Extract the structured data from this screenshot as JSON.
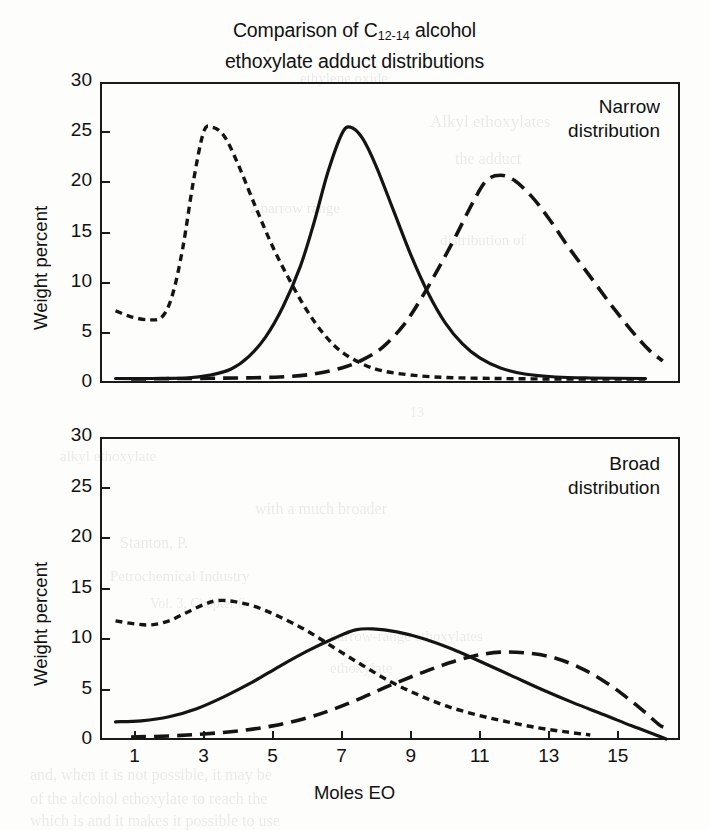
{
  "figure": {
    "title_line1_pre": "Comparison of C",
    "title_sub": "12-14",
    "title_line1_post": " alcohol",
    "title_line2": "ethoxylate adduct distributions",
    "ink_color": "#141414"
  },
  "axes": {
    "ylabel": "Weight percent",
    "xlabel": "Moles EO",
    "yticks": [
      "0",
      "5",
      "10",
      "15",
      "20",
      "25",
      "30"
    ],
    "xticks": [
      "1",
      "3",
      "5",
      "7",
      "9",
      "11",
      "13",
      "15"
    ]
  },
  "panels": {
    "top": {
      "annotation_line1": "Narrow",
      "annotation_line2": "distribution"
    },
    "bottom": {
      "annotation_line1": "Broad",
      "annotation_line2": "distribution"
    }
  },
  "bleed_through": [
    {
      "text": "ethylene oxide",
      "x": 300,
      "y": 70,
      "size": 15
    },
    {
      "text": "Alkyl ethoxylates",
      "x": 430,
      "y": 112,
      "size": 17
    },
    {
      "text": "the adduct",
      "x": 455,
      "y": 150,
      "size": 16
    },
    {
      "text": "a narrow range",
      "x": 250,
      "y": 200,
      "size": 15
    },
    {
      "text": "distribution of",
      "x": 440,
      "y": 232,
      "size": 15
    },
    {
      "text": "13",
      "x": 410,
      "y": 405,
      "size": 14
    },
    {
      "text": "alkyl ethoxylate",
      "x": 60,
      "y": 448,
      "size": 15
    },
    {
      "text": "with a much broader",
      "x": 255,
      "y": 500,
      "size": 16
    },
    {
      "text": "Stanton, P.",
      "x": 120,
      "y": 534,
      "size": 16
    },
    {
      "text": "Petrochemical Industry",
      "x": 110,
      "y": 568,
      "size": 15
    },
    {
      "text": "Vol. 3, Chapter 6",
      "x": 150,
      "y": 596,
      "size": 14
    },
    {
      "text": "narrow-range ethoxylates",
      "x": 330,
      "y": 628,
      "size": 15
    },
    {
      "text": "ethoxylate",
      "x": 330,
      "y": 660,
      "size": 15
    },
    {
      "text": "and, when it is not possible, it may be",
      "x": 30,
      "y": 766,
      "size": 16
    },
    {
      "text": "of the alcohol ethoxylate to reach the",
      "x": 30,
      "y": 790,
      "size": 16
    },
    {
      "text": "which is and it makes it possible to use",
      "x": 30,
      "y": 812,
      "size": 16
    }
  ],
  "chart_data": [
    {
      "type": "line",
      "title": "Narrow distribution",
      "xlabel": "Moles EO",
      "ylabel": "Weight percent",
      "xlim": [
        0,
        16.8
      ],
      "ylim": [
        0,
        30
      ],
      "grid": false,
      "legend": "none",
      "series": [
        {
          "name": "short-dash distribution (low adduct)",
          "style": "short-dash",
          "peak_x": 3.0,
          "peak_y": 25.5,
          "points": [
            [
              0.45,
              7.2
            ],
            [
              0.9,
              6.6
            ],
            [
              1.4,
              6.3
            ],
            [
              1.8,
              6.6
            ],
            [
              2.1,
              8.8
            ],
            [
              2.4,
              13.5
            ],
            [
              2.7,
              20.0
            ],
            [
              3.0,
              25.0
            ],
            [
              3.25,
              25.5
            ],
            [
              3.6,
              24.6
            ],
            [
              4.0,
              21.8
            ],
            [
              4.5,
              17.6
            ],
            [
              5.0,
              13.6
            ],
            [
              5.5,
              10.2
            ],
            [
              6.0,
              7.2
            ],
            [
              6.5,
              4.8
            ],
            [
              7.0,
              3.1
            ],
            [
              7.6,
              1.9
            ],
            [
              8.2,
              1.2
            ],
            [
              9.0,
              0.8
            ],
            [
              10.0,
              0.55
            ],
            [
              11.5,
              0.45
            ],
            [
              13.0,
              0.4
            ],
            [
              14.5,
              0.4
            ],
            [
              15.8,
              0.4
            ]
          ]
        },
        {
          "name": "solid distribution (mid adduct)",
          "style": "solid",
          "peak_x": 7.0,
          "peak_y": 25.5,
          "points": [
            [
              0.45,
              0.45
            ],
            [
              1.5,
              0.45
            ],
            [
              2.5,
              0.5
            ],
            [
              3.2,
              0.8
            ],
            [
              3.8,
              1.4
            ],
            [
              4.3,
              2.6
            ],
            [
              4.8,
              4.6
            ],
            [
              5.3,
              7.6
            ],
            [
              5.8,
              11.6
            ],
            [
              6.2,
              16.0
            ],
            [
              6.6,
              21.0
            ],
            [
              7.0,
              24.8
            ],
            [
              7.25,
              25.5
            ],
            [
              7.6,
              24.4
            ],
            [
              8.0,
              21.6
            ],
            [
              8.5,
              17.2
            ],
            [
              9.0,
              12.8
            ],
            [
              9.5,
              9.0
            ],
            [
              10.0,
              6.0
            ],
            [
              10.5,
              3.9
            ],
            [
              11.0,
              2.5
            ],
            [
              11.6,
              1.5
            ],
            [
              12.3,
              0.9
            ],
            [
              13.2,
              0.6
            ],
            [
              14.2,
              0.5
            ],
            [
              15.8,
              0.45
            ]
          ]
        },
        {
          "name": "long-dash distribution (high adduct)",
          "style": "long-dash",
          "peak_x": 11.2,
          "peak_y": 20.7,
          "points": [
            [
              0.9,
              0.4
            ],
            [
              2.5,
              0.45
            ],
            [
              4.0,
              0.5
            ],
            [
              5.2,
              0.6
            ],
            [
              6.2,
              0.9
            ],
            [
              7.0,
              1.5
            ],
            [
              7.6,
              2.3
            ],
            [
              8.2,
              3.6
            ],
            [
              8.8,
              5.8
            ],
            [
              9.3,
              8.4
            ],
            [
              9.8,
              11.4
            ],
            [
              10.3,
              14.6
            ],
            [
              10.8,
              18.0
            ],
            [
              11.2,
              20.2
            ],
            [
              11.6,
              20.7
            ],
            [
              12.0,
              20.2
            ],
            [
              12.5,
              18.6
            ],
            [
              13.0,
              16.4
            ],
            [
              13.6,
              13.4
            ],
            [
              14.2,
              10.6
            ],
            [
              14.8,
              7.8
            ],
            [
              15.4,
              5.2
            ],
            [
              15.9,
              3.3
            ],
            [
              16.3,
              2.2
            ]
          ]
        }
      ]
    },
    {
      "type": "line",
      "title": "Broad distribution",
      "xlabel": "Moles EO",
      "ylabel": "Weight percent",
      "xlim": [
        0,
        16.8
      ],
      "ylim": [
        0,
        30
      ],
      "grid": false,
      "legend": "none",
      "series": [
        {
          "name": "short-dash distribution (low adduct)",
          "style": "short-dash",
          "peak_x": 3.3,
          "peak_y": 13.8,
          "points": [
            [
              0.45,
              11.8
            ],
            [
              1.0,
              11.5
            ],
            [
              1.5,
              11.4
            ],
            [
              2.0,
              11.8
            ],
            [
              2.5,
              12.6
            ],
            [
              3.0,
              13.4
            ],
            [
              3.4,
              13.8
            ],
            [
              3.9,
              13.7
            ],
            [
              4.5,
              13.2
            ],
            [
              5.2,
              12.2
            ],
            [
              6.0,
              10.8
            ],
            [
              6.8,
              9.1
            ],
            [
              7.6,
              7.4
            ],
            [
              8.4,
              5.8
            ],
            [
              9.2,
              4.5
            ],
            [
              10.0,
              3.4
            ],
            [
              10.9,
              2.5
            ],
            [
              11.8,
              1.8
            ],
            [
              12.7,
              1.2
            ],
            [
              13.5,
              0.8
            ],
            [
              14.2,
              0.5
            ]
          ]
        },
        {
          "name": "solid distribution (mid adduct)",
          "style": "solid",
          "peak_x": 7.6,
          "peak_y": 11.0,
          "points": [
            [
              0.45,
              1.8
            ],
            [
              1.2,
              1.9
            ],
            [
              2.0,
              2.3
            ],
            [
              2.8,
              3.1
            ],
            [
              3.6,
              4.3
            ],
            [
              4.4,
              5.7
            ],
            [
              5.2,
              7.3
            ],
            [
              6.0,
              8.8
            ],
            [
              6.8,
              10.1
            ],
            [
              7.4,
              10.9
            ],
            [
              7.9,
              11.0
            ],
            [
              8.6,
              10.7
            ],
            [
              9.4,
              10.0
            ],
            [
              10.2,
              9.0
            ],
            [
              11.0,
              7.8
            ],
            [
              11.9,
              6.4
            ],
            [
              12.8,
              5.0
            ],
            [
              13.7,
              3.7
            ],
            [
              14.6,
              2.5
            ],
            [
              15.4,
              1.4
            ],
            [
              16.1,
              0.5
            ],
            [
              16.4,
              0.1
            ]
          ]
        },
        {
          "name": "long-dash distribution (high adduct)",
          "style": "long-dash",
          "peak_x": 11.6,
          "peak_y": 8.7,
          "points": [
            [
              0.9,
              0.3
            ],
            [
              2.0,
              0.4
            ],
            [
              3.0,
              0.6
            ],
            [
              4.0,
              0.9
            ],
            [
              5.0,
              1.4
            ],
            [
              6.0,
              2.2
            ],
            [
              6.8,
              3.1
            ],
            [
              7.6,
              4.2
            ],
            [
              8.4,
              5.4
            ],
            [
              9.2,
              6.5
            ],
            [
              10.0,
              7.5
            ],
            [
              10.8,
              8.3
            ],
            [
              11.6,
              8.7
            ],
            [
              12.4,
              8.6
            ],
            [
              13.2,
              8.1
            ],
            [
              14.0,
              7.0
            ],
            [
              14.7,
              5.6
            ],
            [
              15.3,
              4.1
            ],
            [
              15.8,
              2.7
            ],
            [
              16.2,
              1.5
            ],
            [
              16.4,
              1.2
            ]
          ]
        }
      ]
    }
  ]
}
